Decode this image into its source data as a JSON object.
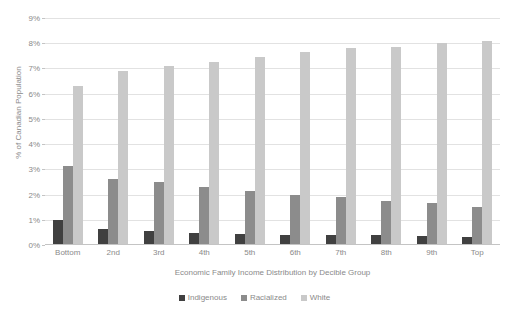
{
  "chart_data": {
    "type": "bar",
    "title": "",
    "xlabel": "Economic Family Income Distribution by Decible Group",
    "ylabel": "% of Canadian Population",
    "ylim": [
      0,
      9
    ],
    "ytick_labels": [
      "0%",
      "1%",
      "2%",
      "3%",
      "4%",
      "5%",
      "6%",
      "7%",
      "8%",
      "9%"
    ],
    "ytick_values": [
      0,
      1,
      2,
      3,
      4,
      5,
      6,
      7,
      8,
      9
    ],
    "grid": true,
    "legend_position": "bottom",
    "categories": [
      "Bottom",
      "2nd",
      "3rd",
      "4th",
      "5th",
      "6th",
      "7th",
      "8th",
      "9th",
      "Top"
    ],
    "series": [
      {
        "name": "Indigenous",
        "color": "#404040",
        "values": [
          1.0,
          0.65,
          0.55,
          0.48,
          0.43,
          0.4,
          0.4,
          0.38,
          0.35,
          0.3
        ]
      },
      {
        "name": "Racialized",
        "color": "#8c8c8c",
        "values": [
          3.15,
          2.6,
          2.5,
          2.3,
          2.15,
          2.0,
          1.9,
          1.75,
          1.65,
          1.5
        ]
      },
      {
        "name": "White",
        "color": "#c9c9c9",
        "values": [
          6.3,
          6.9,
          7.1,
          7.25,
          7.45,
          7.65,
          7.8,
          7.85,
          8.0,
          8.1
        ]
      }
    ]
  },
  "legend": {
    "items": [
      {
        "label": "Indigenous",
        "color": "#404040"
      },
      {
        "label": "Racialized",
        "color": "#8c8c8c"
      },
      {
        "label": "White",
        "color": "#c9c9c9"
      }
    ]
  }
}
